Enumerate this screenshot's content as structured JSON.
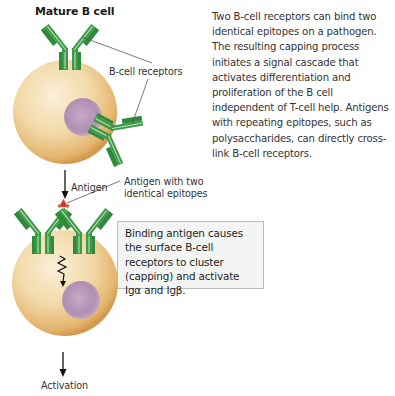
{
  "figure": {
    "title": "Mature B cell",
    "description": "Two B-cell receptors can bind two identical epitopes on a pathogen. The resulting capping process initiates a signal cascade that activates differentiation and proliferation of the B cell independent of T-cell help. Antigens with repeating epitopes, such as polysaccharides, can directly cross-link B-cell receptors.",
    "labels": {
      "bcell_receptors": "B-cell receptors",
      "antigen_arrow": "Antigen",
      "antigen_two_epitopes_line1": "Antigen with two",
      "antigen_two_epitopes_line2": "identical epitopes",
      "activation": "Activation"
    },
    "callout_box": {
      "text": "Binding antigen causes the surface B-cell receptors to cluster (capping) and activate Igα and Igβ."
    },
    "colors": {
      "cell_fill": "#f2d9a8",
      "cell_edge": "#d8a458",
      "nucleus": "#b593b7",
      "receptor_green": "#3e9a4a",
      "receptor_stripe": "#bfe6b8",
      "antigen_red": "#d8342a",
      "box_bg": "#f3f5f2",
      "box_border": "#b7bdb7"
    }
  }
}
